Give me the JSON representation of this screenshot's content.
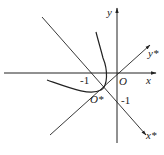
{
  "diagram": {
    "axes": {
      "x_label": "x",
      "y_label": "y",
      "origin_label": "O",
      "x_tick": "-1",
      "y_tick": "-1"
    },
    "rotated_axes": {
      "x_star_label": "x*",
      "y_star_label": "y*",
      "origin_star_label": "O*"
    },
    "colors": {
      "line": "#222222",
      "background": "#ffffff"
    }
  }
}
